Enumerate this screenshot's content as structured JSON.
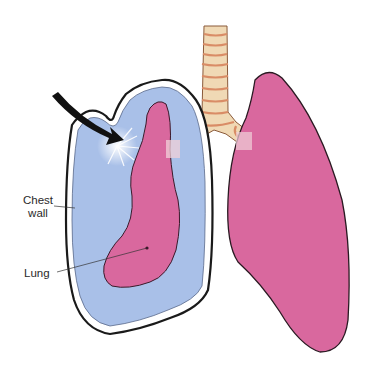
{
  "diagram": {
    "type": "anatomical-illustration",
    "labels": {
      "chest_wall_line1": "Chest",
      "chest_wall_line2": "wall",
      "lung": "Lung"
    },
    "colors": {
      "lung": "#d9689e",
      "pleural_space": "#a9c0e8",
      "trachea": "#f0d9b5",
      "trachea_rings": "#e3a27c",
      "outline": "#2a1a22",
      "arrow": "#111111"
    }
  }
}
